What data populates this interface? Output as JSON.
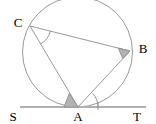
{
  "figure": {
    "width": 156,
    "height": 124,
    "background": "#ffffff"
  },
  "style": {
    "circle_stroke": "#8c8c8c",
    "chord_stroke": "#8c8c8c",
    "tangent_stroke": "#b0b0b0",
    "arc_stroke": "#8c8c8c",
    "angle_fill": "#b3b3b3",
    "label_color": "#000000",
    "stroke_width": 0.9,
    "tangent_width": 2.0
  },
  "circle": {
    "name": "circumscribed-circle",
    "cx": 77.5,
    "cy": 52,
    "r": 55
  },
  "points": [
    {
      "id": "C",
      "label": "C",
      "x": 30,
      "y": 26,
      "label_x": 18,
      "label_y": 22
    },
    {
      "id": "B",
      "label": "B",
      "x": 130,
      "y": 51,
      "label_x": 143,
      "label_y": 48
    },
    {
      "id": "A",
      "label": "A",
      "x": 78,
      "y": 107,
      "label_x": 78,
      "label_y": 116
    },
    {
      "id": "S",
      "label": "S",
      "x": 21,
      "y": 107,
      "label_x": 13,
      "label_y": 116
    },
    {
      "id": "T",
      "label": "T",
      "x": 145,
      "y": 107,
      "label_x": 137,
      "label_y": 116
    }
  ],
  "segments": [
    {
      "id": "CB",
      "name": "chord-c-b",
      "x1": 30,
      "y1": 26,
      "x2": 130,
      "y2": 51
    },
    {
      "id": "CA",
      "name": "chord-c-a",
      "x1": 30,
      "y1": 26,
      "x2": 78,
      "y2": 107
    },
    {
      "id": "BA",
      "name": "chord-b-a",
      "x1": 130,
      "y1": 51,
      "x2": 78,
      "y2": 107
    }
  ],
  "tangent": {
    "id": "ST",
    "name": "tangent-line-s-t",
    "x1": 20,
    "y1": 107,
    "x2": 146,
    "y2": 107
  },
  "angles": [
    {
      "id": "angle-ACB",
      "name": "angle-arc-at-c",
      "vertex": "C",
      "filled": false,
      "path": "M 50.4 31.1 A 21 21 0 0 1 40.8 43.9",
      "radius": 21
    },
    {
      "id": "angle-CBA",
      "name": "angle-wedge-at-b",
      "vertex": "B",
      "filled": true,
      "path": "M 130 51 L 118.3 48.1 L 122.7 58.4 Z",
      "radius": 12
    },
    {
      "id": "angle-CAS",
      "name": "angle-wedge-at-a-left",
      "vertex": "A",
      "filled": true,
      "path": "M 78 107 L 64 107 L 69.3 93.5 Z",
      "radius": 14
    },
    {
      "id": "angle-BAT",
      "name": "angle-arc-at-a-right",
      "vertex": "A",
      "filled": false,
      "path": "M 98 107 A 20 20 0 0 0 92.8 93.6",
      "radius": 20
    }
  ],
  "tick": {
    "name": "tangent-tick-mark",
    "x1": 98,
    "y1": 102,
    "x2": 98,
    "y2": 110
  }
}
